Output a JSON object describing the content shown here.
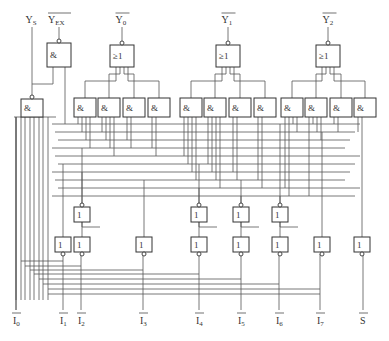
{
  "outputs": [
    {
      "id": "ys",
      "text": "Y",
      "sub": "S",
      "overline": false,
      "x": 32
    },
    {
      "id": "yex",
      "text": "Y",
      "sub": "EX",
      "overline": true,
      "x": 59
    },
    {
      "id": "y0",
      "text": "Y",
      "sub": "0",
      "overline": true,
      "x": 122
    },
    {
      "id": "y1",
      "text": "Y",
      "sub": "1",
      "overline": true,
      "x": 228
    },
    {
      "id": "y2",
      "text": "Y",
      "sub": "2",
      "overline": true,
      "x": 329
    }
  ],
  "inputs": [
    {
      "id": "i0",
      "text": "I",
      "sub": "0",
      "x": 16
    },
    {
      "id": "i1",
      "text": "I",
      "sub": "1",
      "x": 63
    },
    {
      "id": "i2",
      "text": "I",
      "sub": "2",
      "x": 81
    },
    {
      "id": "i3",
      "text": "I",
      "sub": "3",
      "x": 143
    },
    {
      "id": "i4",
      "text": "I",
      "sub": "4",
      "x": 199
    },
    {
      "id": "i5",
      "text": "I",
      "sub": "5",
      "x": 241
    },
    {
      "id": "i6",
      "text": "I",
      "sub": "6",
      "x": 279
    },
    {
      "id": "i7",
      "text": "I",
      "sub": "7",
      "x": 320
    },
    {
      "id": "s",
      "text": "S",
      "sub": "",
      "x": 363
    }
  ],
  "gate_symbols": {
    "and": "&",
    "or": "≥1",
    "not": "1"
  },
  "top_gates": [
    {
      "id": "ex-and",
      "type": "and",
      "x": 47,
      "y": 43,
      "w": 24,
      "h": 24
    },
    {
      "id": "y0-or",
      "type": "or",
      "x": 110,
      "y": 45,
      "w": 24,
      "h": 22
    },
    {
      "id": "y1-or",
      "type": "or",
      "x": 216,
      "y": 45,
      "w": 24,
      "h": 22
    },
    {
      "id": "y2-or",
      "type": "or",
      "x": 316,
      "y": 45,
      "w": 24,
      "h": 22
    }
  ],
  "ys_gate": {
    "id": "ys-and",
    "type": "and",
    "x": 21,
    "y": 99,
    "w": 22,
    "h": 18
  },
  "and_row": [
    {
      "x": 74
    },
    {
      "x": 98
    },
    {
      "x": 123
    },
    {
      "x": 148
    },
    {
      "x": 180
    },
    {
      "x": 204
    },
    {
      "x": 229
    },
    {
      "x": 254
    },
    {
      "x": 281
    },
    {
      "x": 305
    },
    {
      "x": 330
    },
    {
      "x": 354
    }
  ],
  "mid_not_gates": [
    {
      "x": 74
    },
    {
      "x": 191
    },
    {
      "x": 233
    },
    {
      "x": 272
    }
  ],
  "bottom_not_gates": [
    {
      "x": 55,
      "input": "i1"
    },
    {
      "x": 74,
      "input": "i2"
    },
    {
      "x": 136,
      "input": "i3"
    },
    {
      "x": 191,
      "input": "i4"
    },
    {
      "x": 233,
      "input": "i5"
    },
    {
      "x": 272,
      "input": "i6"
    },
    {
      "x": 314,
      "input": "i7"
    },
    {
      "x": 354,
      "input": "s"
    }
  ]
}
